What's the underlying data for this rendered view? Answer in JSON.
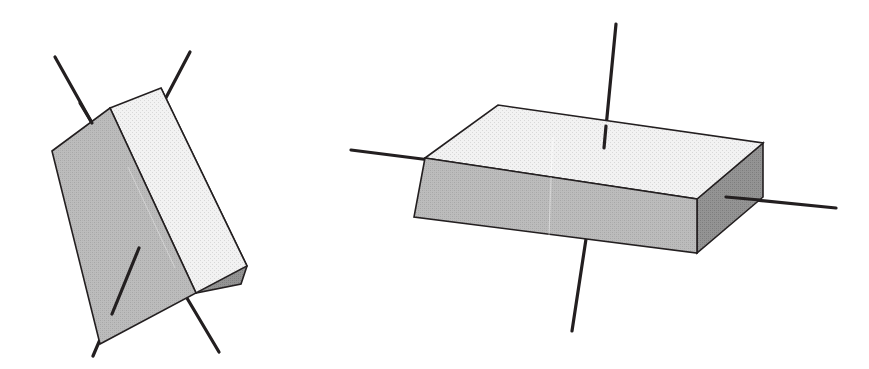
{
  "figure": {
    "title": "Two shaded rectangular boxes with orientation axes",
    "background_color": "#ffffff",
    "width": 869,
    "height": 369,
    "stroke_color": "#231f20",
    "axis_stroke_color": "#231f20",
    "axis_stroke_width": 3.2,
    "edge_stroke_width": 1.6,
    "palette": {
      "top_face": "#e6e6e6",
      "top_face_alt": "#ededed",
      "front_face": "#b5b5b5",
      "side_face_dark": "#8d8d8d",
      "outline": "#231f20",
      "background": "#ffffff"
    },
    "objects": [
      {
        "id": "left-box",
        "name": "tilted-box",
        "label": "Rotated rectangular box",
        "orientation": "tilted / rotated about vertical axis",
        "faces": [
          {
            "name": "top-face",
            "fill": "#ededed",
            "points": "110,108 161,88 247,266 196,293"
          },
          {
            "name": "front-face",
            "fill": "#b5b5b5",
            "points": "52,151 110,108 196,293 100,344"
          },
          {
            "name": "right-side-face",
            "fill": "#8d8d8d",
            "points": "161,88 247,266 241,284 196,293"
          }
        ],
        "axes": [
          {
            "name": "axis-upper-left",
            "x1": 55,
            "y1": 57,
            "x2": 92,
            "y2": 123
          },
          {
            "name": "axis-upper-right",
            "x1": 190,
            "y1": 52,
            "x2": 150,
            "y2": 128
          },
          {
            "name": "axis-lower-left",
            "x1": 93,
            "y1": 356,
            "x2": 139,
            "y2": 248
          },
          {
            "name": "axis-lower-right",
            "x1": 219,
            "y1": 352,
            "x2": 178,
            "y2": 283
          }
        ]
      },
      {
        "id": "right-box",
        "name": "flat-box",
        "label": "Flat rectangular box (slab)",
        "orientation": "axis-aligned / upright slab",
        "faces": [
          {
            "name": "top-face",
            "fill": "#e6e6e6",
            "points": "425,158 498,105 763,143 697,199"
          },
          {
            "name": "front-face",
            "fill": "#b5b5b5",
            "points": "425,158 697,199 697,253 414,217"
          },
          {
            "name": "right-side-face",
            "fill": "#8d8d8d",
            "points": "697,199 763,143 763,197 697,253"
          }
        ],
        "axes": [
          {
            "name": "axis-left-horizontal",
            "x1": 351,
            "y1": 150,
            "x2": 430,
            "y2": 160
          },
          {
            "name": "axis-right-horizontal",
            "x1": 726,
            "y1": 197,
            "x2": 836,
            "y2": 208
          },
          {
            "name": "axis-vertical-top",
            "x1": 616,
            "y1": 24,
            "x2": 604,
            "y2": 148
          },
          {
            "name": "axis-vertical-bottom",
            "x1": 586,
            "y1": 239,
            "x2": 572,
            "y2": 331
          }
        ]
      }
    ]
  }
}
